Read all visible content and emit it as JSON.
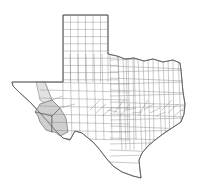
{
  "map": {
    "title": "",
    "region": "Texas",
    "subdivision": "counties",
    "colors": {
      "background": "#ffffff",
      "county_fill": "#ffffff",
      "county_border": "#8a8a8a",
      "highlight_fill": "#cfcfcf",
      "highlight_light_fill": "#e2e2e2"
    },
    "highlighted_counties": [
      "Presidio",
      "Jeff Davis",
      "Brewster"
    ],
    "lightly_highlighted_counties": [
      "Hudspeth"
    ]
  }
}
